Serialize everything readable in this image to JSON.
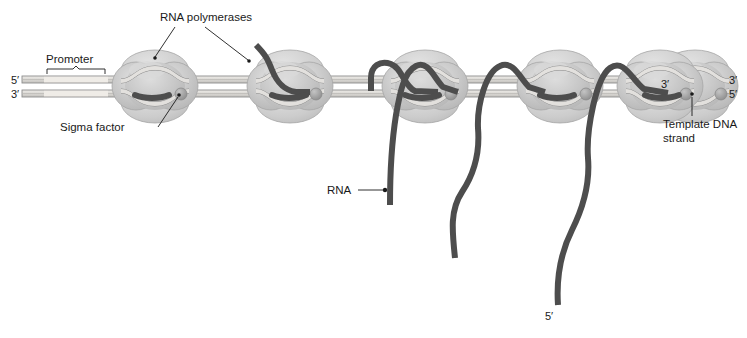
{
  "figure": {
    "background_color": "#ffffff"
  },
  "colors": {
    "polymerase_fill": "#c6c6c6",
    "polymerase_lobe": "#bdbdbd",
    "polymerase_highlight": "#d6d6d6",
    "polymerase_outline": "#9a9a9a",
    "dna_fill": "#d8d6d2",
    "dna_outline": "#8d8d8d",
    "promoter_fill": "#e8e6e2",
    "rna_color": "#4d4d4d",
    "sigma_factor_color": "#9b9b9b",
    "label_color": "#1a1a1a",
    "leader_line_color": "#1a1a1a"
  },
  "labels": {
    "rna_polymerases": "RNA polymerases",
    "promoter": "Promoter",
    "sigma_factor": "Sigma factor",
    "rna": "RNA",
    "template_dna_strand_line1": "Template DNA",
    "template_dna_strand_line2": "strand",
    "dna_left_top_prime": "5′",
    "dna_left_bottom_prime": "3′",
    "dna_right_top_prime": "3′",
    "dna_right_bottom_prime": "5′",
    "rna_three_prime_in_polymerase": "3′",
    "rna_five_prime_free_end": "5′"
  },
  "icons": {
    "sigma_factor": "sigma-factor-bead-icon",
    "promoter_bracket": "promoter-bracket-icon"
  },
  "diagram_data": {
    "type": "schematic",
    "polymerase_count": 6,
    "polymerase_centers_x": [
      155,
      290,
      425,
      560,
      695,
      830
    ],
    "dna_axis_y": 84,
    "description": "Six RNA polymerase complexes move left to right along a double-stranded DNA template; each carries a growing RNA transcript, progressively longer toward the right."
  }
}
